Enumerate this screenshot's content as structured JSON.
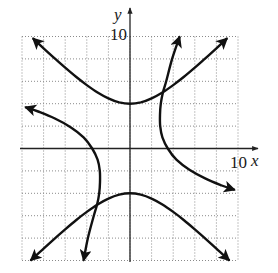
{
  "chart_data": {
    "type": "line",
    "title": "",
    "xlabel": "x",
    "ylabel": "y",
    "xlim": [
      -10,
      10
    ],
    "ylim": [
      -10,
      10
    ],
    "x_tick_label": "10",
    "y_tick_label": "10",
    "grid": true,
    "grid_step": 2,
    "grid_style": "dotted",
    "legend": null,
    "series": [
      {
        "name": "upper branch of y^2 - x^2 = 16",
        "arrows": "both",
        "points": [
          [
            -9,
            9.85
          ],
          [
            -8,
            8.94
          ],
          [
            -7,
            8.06
          ],
          [
            -6,
            7.21
          ],
          [
            -5,
            6.4
          ],
          [
            -4,
            5.66
          ],
          [
            -3,
            5
          ],
          [
            -2,
            4.47
          ],
          [
            -1,
            4.12
          ],
          [
            0,
            4
          ],
          [
            1,
            4.12
          ],
          [
            2,
            4.47
          ],
          [
            3,
            5
          ],
          [
            4,
            5.66
          ],
          [
            5,
            6.4
          ],
          [
            6,
            7.21
          ],
          [
            7,
            8.06
          ],
          [
            8,
            8.94
          ],
          [
            9,
            9.85
          ]
        ]
      },
      {
        "name": "lower branch of y^2 - x^2 = 16",
        "arrows": "both",
        "points": [
          [
            -9.2,
            -10
          ],
          [
            -8,
            -8.94
          ],
          [
            -7,
            -8.06
          ],
          [
            -6,
            -7.21
          ],
          [
            -5,
            -6.4
          ],
          [
            -4,
            -5.66
          ],
          [
            -3,
            -5
          ],
          [
            -2,
            -4.47
          ],
          [
            -1,
            -4.12
          ],
          [
            0,
            -4
          ],
          [
            1,
            -4.12
          ],
          [
            2,
            -4.47
          ],
          [
            3,
            -5
          ],
          [
            4,
            -5.66
          ],
          [
            5,
            -6.4
          ],
          [
            6,
            -7.21
          ],
          [
            7,
            -8.06
          ],
          [
            8,
            -8.94
          ],
          [
            9.2,
            -10
          ]
        ]
      },
      {
        "name": "right branch of rotated hyperbola",
        "arrows": "both",
        "points": [
          [
            4.6,
            10
          ],
          [
            3.9,
            8
          ],
          [
            3.35,
            6
          ],
          [
            3.05,
            5
          ],
          [
            2.85,
            4
          ],
          [
            2.78,
            3
          ],
          [
            2.8,
            2
          ],
          [
            3.0,
            1
          ],
          [
            3.5,
            0
          ],
          [
            4.3,
            -1
          ],
          [
            5.5,
            -1.9
          ],
          [
            7,
            -2.7
          ],
          [
            8.5,
            -3.3
          ],
          [
            9.7,
            -3.7
          ]
        ]
      },
      {
        "name": "left branch of rotated hyperbola",
        "arrows": "both",
        "points": [
          [
            -9.7,
            3.7
          ],
          [
            -8.5,
            3.3
          ],
          [
            -7,
            2.7
          ],
          [
            -5.5,
            1.9
          ],
          [
            -4.3,
            1
          ],
          [
            -3.5,
            0
          ],
          [
            -3.0,
            -1
          ],
          [
            -2.8,
            -2
          ],
          [
            -2.78,
            -3
          ],
          [
            -2.85,
            -4
          ],
          [
            -3.05,
            -5
          ],
          [
            -3.35,
            -6
          ],
          [
            -3.9,
            -8
          ],
          [
            -4.3,
            -10
          ]
        ]
      }
    ]
  },
  "axes": {
    "x_label": "x",
    "y_label": "y",
    "x_max_label": "10",
    "y_max_label": "10"
  },
  "colors": {
    "curve": "#111111",
    "axis": "#222222",
    "grid": "#8a8a8a"
  }
}
